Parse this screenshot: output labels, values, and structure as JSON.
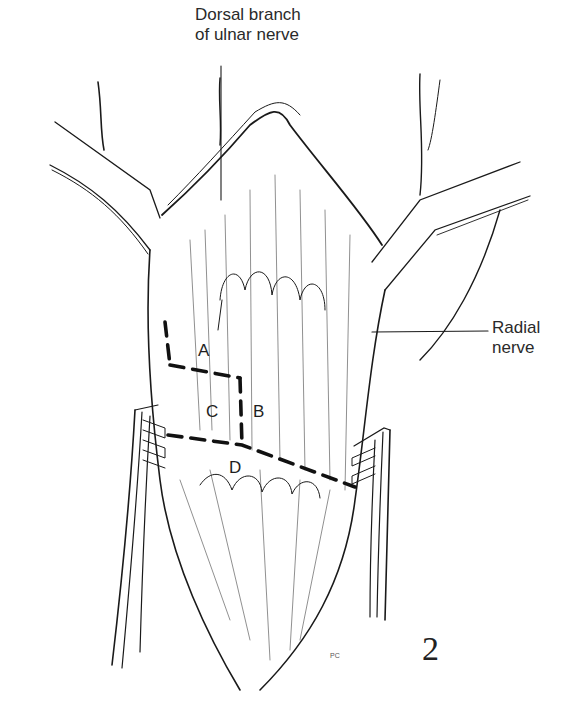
{
  "labels": {
    "dorsal_line1": "Dorsal branch",
    "dorsal_line2": "of ulnar nerve",
    "radial_line1": "Radial",
    "radial_line2": "nerve"
  },
  "regions": {
    "a": "A",
    "b": "B",
    "c": "C",
    "d": "D"
  },
  "figure_number": "2",
  "artist_mark": "PC",
  "colors": {
    "ink": "#1a1a1a",
    "background": "#ffffff",
    "label": "#2a2a2a"
  }
}
